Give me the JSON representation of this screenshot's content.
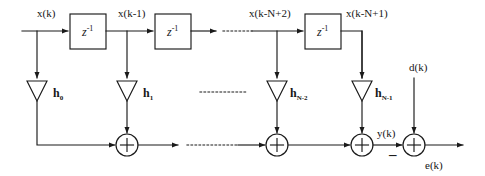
{
  "diagram": {
    "stroke_color": "#1a1a1a",
    "background": "#ffffff",
    "delay_blocks": [
      {
        "name": "delay-1",
        "label_base": "z",
        "label_exp": "-1"
      },
      {
        "name": "delay-2",
        "label_base": "z",
        "label_exp": "-1"
      },
      {
        "name": "delay-3",
        "label_base": "z",
        "label_exp": "-1"
      }
    ],
    "signal_labels": {
      "input": "x(k)",
      "tap1": "x(k-1)",
      "tap_n2": "x(k-N+2)",
      "tap_n1": "x(k-N+1)",
      "desired": "d(k)",
      "output": "y(k)",
      "error": "e(k)",
      "minus_sign": "–"
    },
    "coefficients": [
      {
        "name": "gain-h0",
        "base": "h",
        "sub": "0"
      },
      {
        "name": "gain-h1",
        "base": "h",
        "sub": "1"
      },
      {
        "name": "gain-hn2",
        "base": "h",
        "sub": "N-2"
      },
      {
        "name": "gain-hn1",
        "base": "h",
        "sub": "N-1"
      }
    ],
    "adders": [
      {
        "name": "adder-1",
        "symbol": "+"
      },
      {
        "name": "adder-2",
        "symbol": "+"
      },
      {
        "name": "adder-3",
        "symbol": "+"
      },
      {
        "name": "adder-error",
        "symbol": "+"
      }
    ],
    "ellipses": [
      {
        "name": "ellipsis-top"
      },
      {
        "name": "ellipsis-middle-upper"
      },
      {
        "name": "ellipsis-middle-lower"
      }
    ]
  }
}
